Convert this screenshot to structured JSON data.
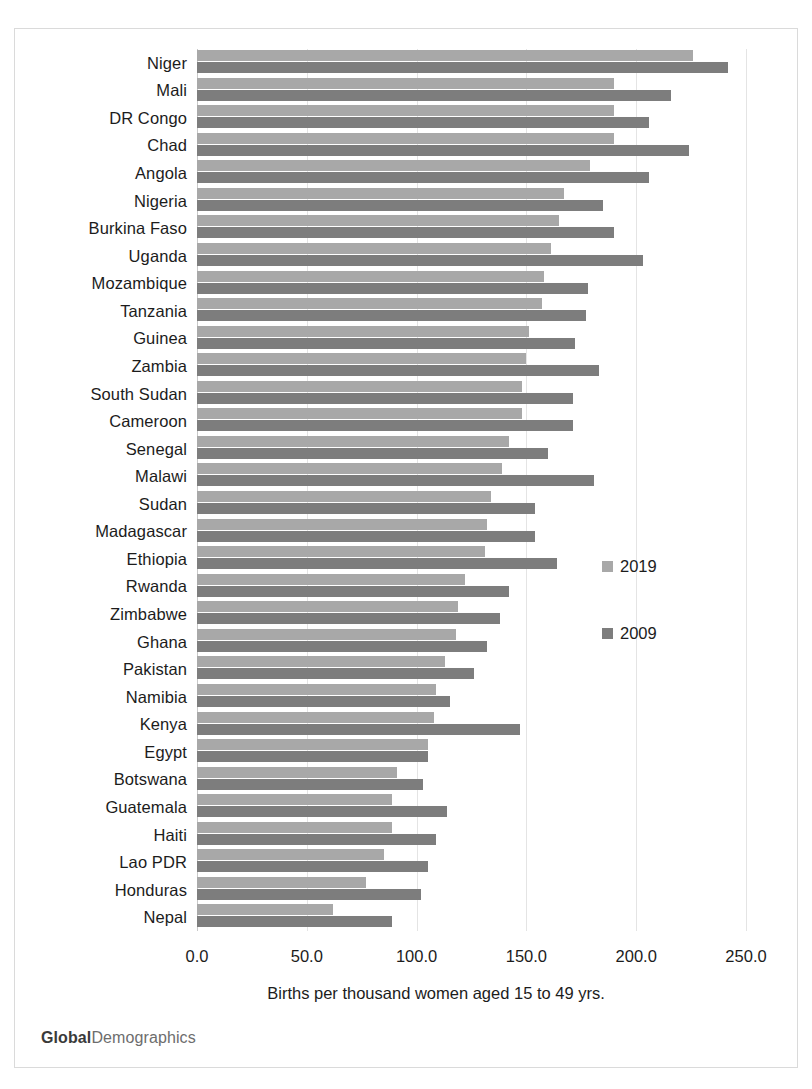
{
  "brand": {
    "bold_part": "Global",
    "light_part": "Demographics"
  },
  "legend": {
    "position": "right-middle",
    "entries": [
      {
        "label": "2019",
        "color": "#a8a8a8"
      },
      {
        "label": "2009",
        "color": "#7d7d7d"
      }
    ]
  },
  "axis": {
    "x_title": "Births per thousand women aged 15 to 49 yrs.",
    "x_ticks": [
      "0.0",
      "50.0",
      "100.0",
      "150.0",
      "200.0",
      "250.0"
    ],
    "x_tick_values": [
      0,
      50,
      100,
      150,
      200,
      250
    ]
  },
  "chart_data": {
    "type": "bar",
    "orientation": "horizontal",
    "title": "",
    "subtitle": "",
    "xlabel": "Births per thousand women aged 15 to 49 yrs.",
    "ylabel": "",
    "xlim": [
      0,
      250
    ],
    "grid": true,
    "legend_position": "right",
    "categories": [
      "Niger",
      "Mali",
      "DR Congo",
      "Chad",
      "Angola",
      "Nigeria",
      "Burkina Faso",
      "Uganda",
      "Mozambique",
      "Tanzania",
      "Guinea",
      "Zambia",
      "South Sudan",
      "Cameroon",
      "Senegal",
      "Malawi",
      "Sudan",
      "Madagascar",
      "Ethiopia",
      "Rwanda",
      "Zimbabwe",
      "Ghana",
      "Pakistan",
      "Namibia",
      "Kenya",
      "Egypt",
      "Botswana",
      "Guatemala",
      "Haiti",
      "Lao PDR",
      "Honduras",
      "Nepal"
    ],
    "series": [
      {
        "name": "2019",
        "color": "#a8a8a8",
        "values": [
          226,
          190,
          190,
          190,
          179,
          167,
          165,
          161,
          158,
          157,
          151,
          150,
          148,
          148,
          142,
          139,
          134,
          132,
          131,
          122,
          119,
          118,
          113,
          109,
          108,
          105,
          91,
          89,
          89,
          85,
          77,
          62
        ]
      },
      {
        "name": "2009",
        "color": "#7d7d7d",
        "values": [
          242,
          216,
          206,
          224,
          206,
          185,
          190,
          203,
          178,
          177,
          172,
          183,
          171,
          171,
          160,
          181,
          154,
          154,
          164,
          142,
          138,
          132,
          126,
          115,
          147,
          105,
          103,
          114,
          109,
          105,
          102,
          89
        ]
      }
    ]
  }
}
